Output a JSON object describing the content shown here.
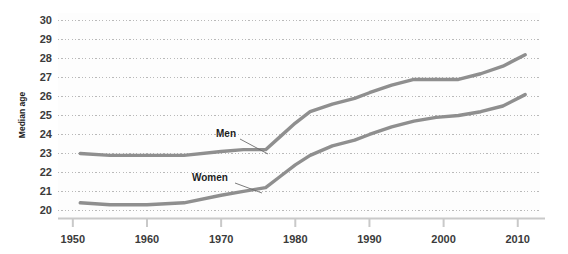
{
  "chart_data": {
    "type": "line",
    "title": "",
    "subtitle": "",
    "xlabel": "",
    "ylabel": "Median age",
    "xlim": [
      1948,
      2013
    ],
    "ylim": [
      19.6,
      30.4
    ],
    "x_ticks": [
      1950,
      1960,
      1970,
      1980,
      1990,
      2000,
      2010
    ],
    "y_ticks": [
      20,
      21,
      22,
      23,
      24,
      25,
      26,
      27,
      28,
      29,
      30
    ],
    "grid": "horizontal-dotted",
    "legend": "inline-labels",
    "series": [
      {
        "name": "Men",
        "color": "#8f8f8f",
        "label_x": 1972,
        "label_y": 24.2,
        "x": [
          1951,
          1955,
          1960,
          1965,
          1970,
          1973,
          1976,
          1978,
          1980,
          1982,
          1985,
          1988,
          1990,
          1993,
          1996,
          1999,
          2002,
          2005,
          2008,
          2011
        ],
        "values": [
          23.0,
          22.9,
          22.9,
          22.9,
          23.1,
          23.2,
          23.2,
          23.9,
          24.6,
          25.2,
          25.6,
          25.9,
          26.2,
          26.6,
          26.9,
          26.9,
          26.9,
          27.2,
          27.6,
          28.2
        ]
      },
      {
        "name": "Women",
        "color": "#8f8f8f",
        "label_x": 1968,
        "label_y": 21.5,
        "x": [
          1951,
          1955,
          1960,
          1965,
          1970,
          1973,
          1976,
          1978,
          1980,
          1982,
          1985,
          1988,
          1990,
          1993,
          1996,
          1999,
          2002,
          2005,
          2008,
          2011
        ],
        "values": [
          20.4,
          20.3,
          20.3,
          20.4,
          20.8,
          21.0,
          21.2,
          21.8,
          22.4,
          22.9,
          23.4,
          23.7,
          24.0,
          24.4,
          24.7,
          24.9,
          25.0,
          25.2,
          25.5,
          26.1
        ]
      }
    ]
  },
  "axis": {
    "y_title": "Median age",
    "y_tick_labels": [
      "30",
      "29",
      "28",
      "27",
      "26",
      "25",
      "24",
      "23",
      "22",
      "21",
      "20"
    ],
    "x_tick_labels": [
      "1950",
      "1960",
      "1970",
      "1980",
      "1990",
      "2000",
      "2010"
    ]
  },
  "series_labels": {
    "men": "Men",
    "women": "Women"
  },
  "colors": {
    "line": "#8f8f8f",
    "grid": "#b9b9b9",
    "axis": "#c9c9c9",
    "text": "#3b3b3b",
    "plot_bg": "#fdfdfd"
  }
}
